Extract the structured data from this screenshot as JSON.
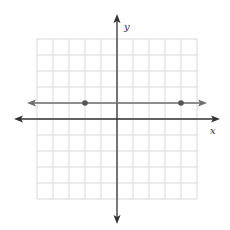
{
  "figure": {
    "type": "coordinate-plane",
    "width": 230,
    "height": 230
  },
  "axes": {
    "x_label": "x",
    "y_label": "y",
    "x_range": [
      -5,
      5
    ],
    "y_range": [
      -5,
      5
    ],
    "grid": true,
    "grid_step": 1
  },
  "line": {
    "description": "horizontal line with arrows on both ends",
    "equation": "y = 1",
    "y": 1
  },
  "points": [
    {
      "x": -2,
      "y": 1
    },
    {
      "x": 4,
      "y": 1
    }
  ],
  "colors": {
    "grid": "#d9d9d9",
    "axes": "#333333",
    "line": "#6e6e6e",
    "points": "#555555",
    "background": "#ffffff"
  }
}
